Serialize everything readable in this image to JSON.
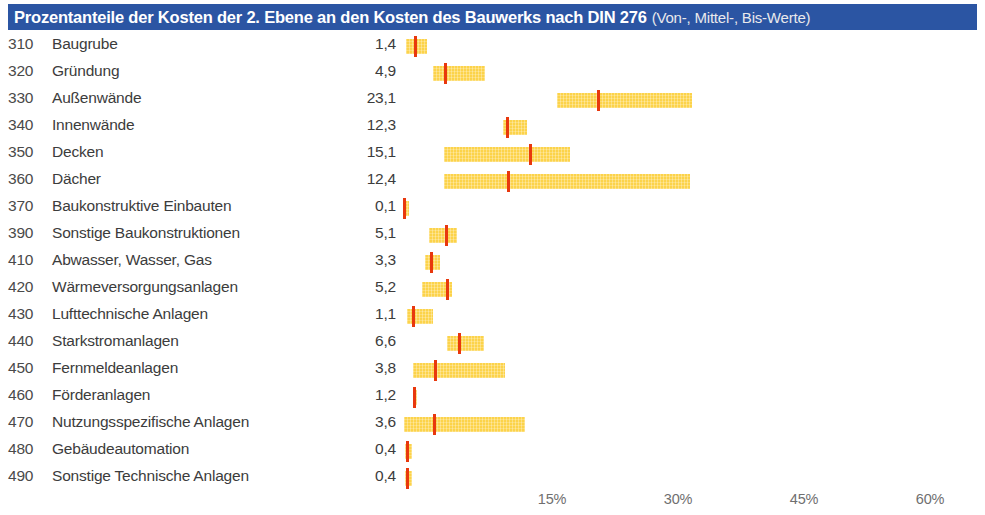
{
  "title": {
    "main": "Prozentanteile der Kosten der 2. Ebene an den Kosten des Bauwerks nach DIN 276",
    "sub": "(Von-, Mittel-, Bis-Werte)",
    "bar_color": "#2b55a3",
    "text_color": "#ffffff"
  },
  "colors": {
    "range_bar": "#fcd34a",
    "mean_marker": "#e8380d",
    "label_text": "#3c3c3c",
    "tick_text": "#6f6f6f"
  },
  "chart_data": {
    "type": "bar",
    "title": "Prozentanteile der Kosten der 2. Ebene an den Kosten des Bauwerks nach DIN 276",
    "subtitle": "(Von-, Mittel-, Bis-Werte)",
    "xlabel": "",
    "ylabel": "",
    "xlim": [
      0,
      65
    ],
    "grid": false,
    "legend": null,
    "xticks": [
      15,
      30,
      45,
      60
    ],
    "xtick_labels": [
      "15%",
      "30%",
      "45%",
      "60%"
    ],
    "value_unit": "%",
    "categories": [
      "310 Baugrube",
      "320 Gründung",
      "330 Außenwände",
      "340 Innenwände",
      "350 Decken",
      "360 Dächer",
      "370 Baukonstruktive Einbauten",
      "390 Sonstige Baukonstruktionen",
      "410 Abwasser, Wasser, Gas",
      "420 Wärmeversorgungsanlagen",
      "430 Lufttechnische Anlagen",
      "440 Starkstromanlagen",
      "450 Fernmeldeanlagen",
      "460 Förderanlagen",
      "470 Nutzungsspezifische Anlagen",
      "480 Gebäudeautomation",
      "490 Sonstige Technische Anlagen"
    ],
    "values": [
      1.4,
      4.9,
      23.1,
      12.3,
      15.1,
      12.4,
      0.1,
      5.1,
      3.3,
      5.2,
      1.1,
      6.6,
      3.8,
      1.2,
      3.6,
      0.4,
      0.4
    ],
    "series": [
      {
        "name": "Von-Wert",
        "values": [
          0.2,
          3.4,
          18.2,
          11.8,
          4.8,
          4.8,
          0.05,
          3.0,
          2.5,
          2.2,
          0.3,
          5.1,
          1.1,
          1.1,
          0.0,
          0.1,
          0.1
        ]
      },
      {
        "name": "Mittel-Wert",
        "values": [
          1.4,
          4.9,
          23.1,
          12.3,
          15.1,
          12.4,
          0.1,
          5.1,
          3.3,
          5.2,
          1.1,
          6.6,
          3.8,
          1.2,
          3.6,
          0.4,
          0.4
        ]
      },
      {
        "name": "Bis-Wert",
        "values": [
          2.7,
          9.6,
          34.3,
          14.6,
          19.8,
          34.0,
          0.6,
          6.3,
          4.3,
          5.7,
          3.5,
          9.5,
          12.0,
          1.4,
          14.4,
          1.0,
          1.0
        ]
      }
    ]
  },
  "rows": [
    {
      "code": "310",
      "label": "Baugrube",
      "value": "1,4",
      "von": 0.2,
      "mittel": 1.4,
      "bis": 2.7
    },
    {
      "code": "320",
      "label": "Gründung",
      "value": "4,9",
      "von": 3.4,
      "mittel": 4.9,
      "bis": 9.6
    },
    {
      "code": "330",
      "label": "Außenwände",
      "value": "23,1",
      "von": 18.2,
      "mittel": 23.1,
      "bis": 34.3
    },
    {
      "code": "340",
      "label": "Innenwände",
      "value": "12,3",
      "von": 11.8,
      "mittel": 12.3,
      "bis": 14.6
    },
    {
      "code": "350",
      "label": "Decken",
      "value": "15,1",
      "von": 4.8,
      "mittel": 15.1,
      "bis": 19.8
    },
    {
      "code": "360",
      "label": "Dächer",
      "value": "12,4",
      "von": 4.8,
      "mittel": 12.4,
      "bis": 34.0
    },
    {
      "code": "370",
      "label": "Baukonstruktive Einbauten",
      "value": "0,1",
      "von": 0.05,
      "mittel": 0.1,
      "bis": 0.6
    },
    {
      "code": "390",
      "label": "Sonstige Baukonstruktionen",
      "value": "5,1",
      "von": 3.0,
      "mittel": 5.1,
      "bis": 6.3
    },
    {
      "code": "410",
      "label": "Abwasser, Wasser, Gas",
      "value": "3,3",
      "von": 2.5,
      "mittel": 3.3,
      "bis": 4.3
    },
    {
      "code": "420",
      "label": "Wärmeversorgungsanlagen",
      "value": "5,2",
      "von": 2.2,
      "mittel": 5.2,
      "bis": 5.7
    },
    {
      "code": "430",
      "label": "Lufttechnische Anlagen",
      "value": "1,1",
      "von": 0.3,
      "mittel": 1.1,
      "bis": 3.5
    },
    {
      "code": "440",
      "label": "Starkstromanlagen",
      "value": "6,6",
      "von": 5.1,
      "mittel": 6.6,
      "bis": 9.5
    },
    {
      "code": "450",
      "label": "Fernmeldeanlagen",
      "value": "3,8",
      "von": 1.1,
      "mittel": 3.8,
      "bis": 12.0
    },
    {
      "code": "460",
      "label": "Förderanlagen",
      "value": "1,2",
      "von": 1.1,
      "mittel": 1.2,
      "bis": 1.4
    },
    {
      "code": "470",
      "label": "Nutzungsspezifische Anlagen",
      "value": "3,6",
      "von": 0.0,
      "mittel": 3.6,
      "bis": 14.4
    },
    {
      "code": "480",
      "label": "Gebäudeautomation",
      "value": "0,4",
      "von": 0.1,
      "mittel": 0.4,
      "bis": 1.0
    },
    {
      "code": "490",
      "label": "Sonstige Technische Anlagen",
      "value": "0,4",
      "von": 0.1,
      "mittel": 0.4,
      "bis": 1.0
    }
  ],
  "axis": {
    "origin_px": 404,
    "px_per_percent": 8.4,
    "row_height_px": 27,
    "ticks": [
      {
        "label": "15%",
        "value": 15
      },
      {
        "label": "30%",
        "value": 30
      },
      {
        "label": "45%",
        "value": 45
      },
      {
        "label": "60%",
        "value": 60
      }
    ]
  }
}
